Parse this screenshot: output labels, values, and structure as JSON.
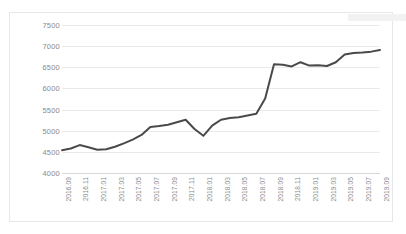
{
  "chart_data": {
    "type": "line",
    "title": "",
    "xlabel": "",
    "ylabel": "",
    "ylim": [
      4000,
      7500
    ],
    "ytick_step": 500,
    "yticks": [
      7500,
      7000,
      6500,
      6000,
      5500,
      5000,
      4500,
      4000
    ],
    "grid": true,
    "legend": false,
    "legend_position": "none",
    "line_color": "#4a4a4a",
    "gridline_color": "#eaeaea",
    "axis_color": "#d8d8d8",
    "tick_label_color": "#8a8a8a",
    "categories": [
      "2016.09",
      "2016.10",
      "2016.11",
      "2016.12",
      "2017.01",
      "2017.02",
      "2017.03",
      "2017.04",
      "2017.05",
      "2017.06",
      "2017.07",
      "2017.08",
      "2017.09",
      "2017.10",
      "2017.11",
      "2017.12",
      "2018.01",
      "2018.02",
      "2018.03",
      "2018.04",
      "2018.05",
      "2018.06",
      "2018.07",
      "2018.08",
      "2018.09",
      "2018.10",
      "2018.11",
      "2018.12",
      "2019.01",
      "2019.02",
      "2019.03",
      "2019.04",
      "2019.05",
      "2019.06",
      "2019.07",
      "2019.08",
      "2019.09"
    ],
    "x_tick_labels": [
      "2016.09",
      "2016.11",
      "2017.01",
      "2017.03",
      "2017.05",
      "2017.07",
      "2017.09",
      "2017.11",
      "2018.01",
      "2018.03",
      "2018.05",
      "2018.07",
      "2018.09",
      "2018.11",
      "2019.01",
      "2019.03",
      "2019.05",
      "2019.07",
      "2019.09"
    ],
    "values": [
      4540,
      4580,
      4660,
      4610,
      4550,
      4560,
      4620,
      4700,
      4790,
      4900,
      5090,
      5110,
      5140,
      5200,
      5260,
      5040,
      4880,
      5120,
      5260,
      5300,
      5320,
      5360,
      5400,
      5760,
      6570,
      6560,
      6520,
      6620,
      6540,
      6550,
      6530,
      6620,
      6800,
      6840,
      6850,
      6870,
      6910
    ],
    "series": [
      {
        "name": "series-1",
        "values": [
          4540,
          4580,
          4660,
          4610,
          4550,
          4560,
          4620,
          4700,
          4790,
          4900,
          5090,
          5110,
          5140,
          5200,
          5260,
          5040,
          4880,
          5120,
          5260,
          5300,
          5320,
          5360,
          5400,
          5760,
          6570,
          6560,
          6520,
          6620,
          6540,
          6550,
          6530,
          6620,
          6800,
          6840,
          6850,
          6870,
          6910
        ]
      }
    ],
    "annotations": []
  }
}
